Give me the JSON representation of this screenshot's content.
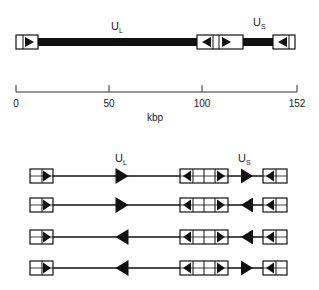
{
  "figure": {
    "genome_map": {
      "regions": {
        "ul": "U",
        "ul_sub": "L",
        "us": "U",
        "us_sub": "S"
      },
      "scale": {
        "ticks": [
          "0",
          "50",
          "100",
          "152"
        ],
        "unit": "kbp",
        "max_kbp": 152
      }
    },
    "isomers": {
      "label_ul": "U",
      "label_ul_sub": "L",
      "label_us": "U",
      "label_us_sub": "S",
      "rows": [
        {
          "ul_orientation": "right",
          "us_orientation": "right"
        },
        {
          "ul_orientation": "right",
          "us_orientation": "left"
        },
        {
          "ul_orientation": "left",
          "us_orientation": "left"
        },
        {
          "ul_orientation": "left",
          "us_orientation": "right"
        }
      ]
    },
    "colors": {
      "ink": "#111111",
      "background": "#ffffff"
    }
  }
}
